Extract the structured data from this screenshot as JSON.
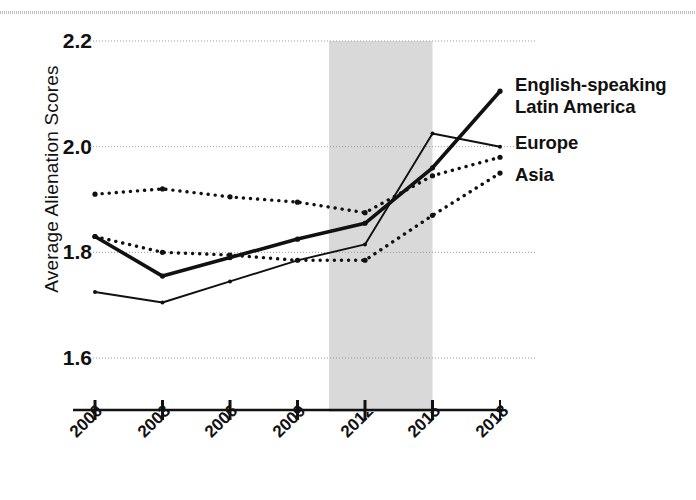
{
  "chart_data": {
    "type": "line",
    "title": "",
    "xlabel": "",
    "ylabel": "Average Alienation Scores",
    "x": [
      2000,
      2003,
      2006,
      2009,
      2012,
      2015,
      2018
    ],
    "xtick_labels": [
      "2000",
      "2003",
      "2006",
      "2009",
      "2012",
      "2015",
      "2018"
    ],
    "ytick_labels": [
      "2.2",
      "2.0",
      "1.8",
      "1.6"
    ],
    "ytick_values": [
      2.2,
      2.0,
      1.8,
      1.6
    ],
    "ylim": [
      1.6,
      2.2
    ],
    "xlim": [
      2000,
      2018
    ],
    "grid": "horizontal-dotted",
    "legend_position": "right-inline-labels",
    "shaded_band": {
      "label": "",
      "x_start": 2010.4,
      "x_end": 2015.0,
      "color": "#d9d9d9"
    },
    "series": [
      {
        "name": "English-speaking",
        "style": "solid-thick",
        "color": "#111111",
        "values": [
          1.83,
          1.755,
          1.79,
          1.825,
          1.855,
          1.96,
          2.105
        ]
      },
      {
        "name": "Latin America",
        "style": "solid-thin",
        "color": "#111111",
        "values": [
          1.725,
          1.705,
          1.745,
          1.785,
          1.815,
          2.025,
          2.0
        ]
      },
      {
        "name": "Europe",
        "style": "dotted",
        "color": "#111111",
        "values": [
          1.91,
          1.92,
          1.905,
          1.895,
          1.875,
          1.945,
          1.98
        ]
      },
      {
        "name": "Asia",
        "style": "dotted",
        "color": "#111111",
        "values": [
          1.83,
          1.8,
          1.795,
          1.785,
          1.785,
          1.87,
          1.95
        ]
      }
    ],
    "annotations": [
      {
        "text": "English-speaking",
        "target_series": "English-speaking"
      },
      {
        "text": "Latin America",
        "target_series": "Latin America"
      },
      {
        "text": "Europe",
        "target_series": "Europe"
      },
      {
        "text": "Asia",
        "target_series": "Asia"
      }
    ]
  },
  "axis": {
    "y_title": "Average Alienation Scores",
    "y_ticks": [
      "2.2",
      "2.0",
      "1.8",
      "1.6"
    ],
    "x_ticks": [
      "2000",
      "2003",
      "2006",
      "2009",
      "2012",
      "2015",
      "2018"
    ]
  },
  "labels": {
    "english_speaking": "English-speaking",
    "latin_america": "Latin America",
    "europe": "Europe",
    "asia": "Asia"
  }
}
